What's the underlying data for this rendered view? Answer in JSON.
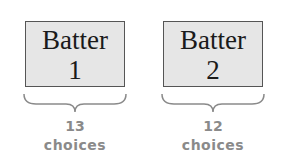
{
  "diagram": {
    "type": "counting-principle-slots",
    "slots": [
      {
        "title": "Batter",
        "number": "1",
        "count": "13",
        "count_label": "choices"
      },
      {
        "title": "Batter",
        "number": "2",
        "count": "12",
        "count_label": "choices"
      }
    ],
    "colors": {
      "box_fill": "#e6e6e6",
      "box_border": "#555555",
      "text": "#1a1a1a",
      "label": "#8a8a8a",
      "brace": "#8a8a8a"
    }
  }
}
